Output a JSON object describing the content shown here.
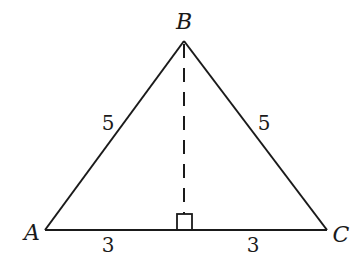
{
  "diagram": {
    "type": "isosceles triangle with altitude",
    "vertices": {
      "A": {
        "label": "A"
      },
      "B": {
        "label": "B"
      },
      "C": {
        "label": "C"
      }
    },
    "side_labels": {
      "AB": "5",
      "BC": "5",
      "A_to_foot": "3",
      "foot_to_C": "3"
    },
    "altitude": {
      "style": "dashed",
      "from": "B",
      "right_angle_marker": true
    },
    "colors": {
      "stroke": "#1a1a1a",
      "background": "#ffffff"
    }
  }
}
